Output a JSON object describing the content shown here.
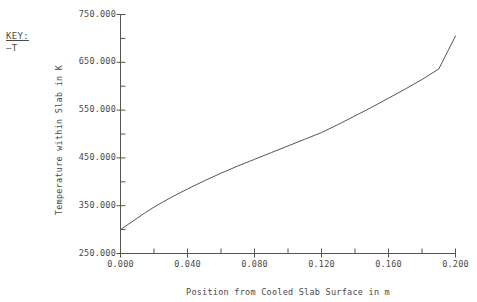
{
  "legend": {
    "title": "KEY:",
    "entries": [
      {
        "marker": "—",
        "label": "T"
      }
    ]
  },
  "axes": {
    "y_title": "Temperature within Slab in K",
    "x_title": "Position from Cooled Slab Surface in m"
  },
  "chart_data": {
    "type": "line",
    "title": "",
    "xlabel": "Position from Cooled Slab Surface in m",
    "ylabel": "Temperature within Slab in K",
    "xlim": [
      0.0,
      0.2
    ],
    "ylim": [
      250.0,
      750.0
    ],
    "grid": false,
    "legend_position": "top-left",
    "x_ticks": [
      0.0,
      0.04,
      0.08,
      0.12,
      0.16,
      0.2
    ],
    "x_tick_labels": [
      "0.000",
      "0.040",
      "0.080",
      "0.120",
      "0.160",
      "0.200"
    ],
    "x_minor_ticks": [
      0.02,
      0.06,
      0.1,
      0.14,
      0.18
    ],
    "y_ticks": [
      250.0,
      350.0,
      450.0,
      550.0,
      650.0,
      750.0
    ],
    "y_tick_labels": [
      "250.000",
      "350.000",
      "450.000",
      "550.000",
      "650.000",
      "750.000"
    ],
    "y_minor_ticks": [
      300.0,
      400.0,
      500.0,
      600.0,
      700.0
    ],
    "series": [
      {
        "name": "T",
        "color": "#555555",
        "x": [
          0.0,
          0.005,
          0.01,
          0.015,
          0.02,
          0.025,
          0.03,
          0.035,
          0.04,
          0.05,
          0.06,
          0.07,
          0.08,
          0.09,
          0.1,
          0.11,
          0.12,
          0.13,
          0.14,
          0.15,
          0.16,
          0.17,
          0.18,
          0.19,
          0.2
        ],
        "y": [
          300.0,
          312.0,
          324.0,
          336.0,
          347.0,
          357.0,
          367.0,
          376.0,
          385.0,
          402.0,
          418.0,
          433.0,
          447.0,
          461.0,
          475.0,
          489.0,
          503.0,
          520.0,
          538.0,
          556.0,
          575.0,
          594.0,
          614.0,
          636.0,
          705.0
        ]
      }
    ]
  }
}
